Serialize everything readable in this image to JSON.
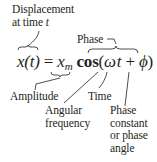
{
  "diagram": {
    "equation": {
      "lhs": "x(t)",
      "equals": "=",
      "amplitude_symbol": "x",
      "amplitude_subscript": "m",
      "function": "cos",
      "open_paren": "(",
      "omega": "ω",
      "time_var": "t",
      "plus": "+",
      "phi": "ϕ",
      "close_paren": ")"
    },
    "labels": {
      "displacement_line1": "Displacement",
      "displacement_line2": "at time",
      "displacement_t": "t",
      "phase": "Phase",
      "amplitude": "Amplitude",
      "angular_line1": "Angular",
      "angular_line2": "frequency",
      "time": "Time",
      "phase_constant_line1": "Phase",
      "phase_constant_line2": "constant",
      "phase_constant_line3": "or phase",
      "phase_constant_line4": "angle"
    },
    "colors": {
      "ink": "#231f20",
      "background": "#ffffff"
    }
  }
}
